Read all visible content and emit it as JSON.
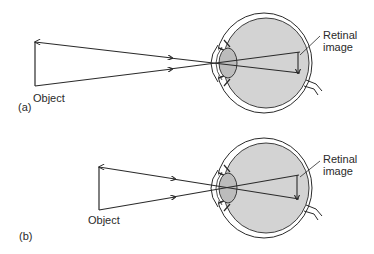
{
  "figure": {
    "panels": [
      {
        "id": "a",
        "panel_label": "(a)",
        "object_label": "Object",
        "retinal_label": "Retinal\nimage",
        "description": "Distant/tall object: rays from object tips cross at lens and form an inverted image on the retina"
      },
      {
        "id": "b",
        "panel_label": "(b)",
        "object_label": "Object",
        "retinal_label": "Retinal\nimage",
        "description": "Closer object: rays subtend a larger angle producing a larger inverted retinal image"
      }
    ]
  },
  "colors": {
    "line": "#2a2a2a",
    "eye_fill": "#d3d3d3",
    "lens_fill": "#bcbcbc",
    "background": "#ffffff"
  }
}
